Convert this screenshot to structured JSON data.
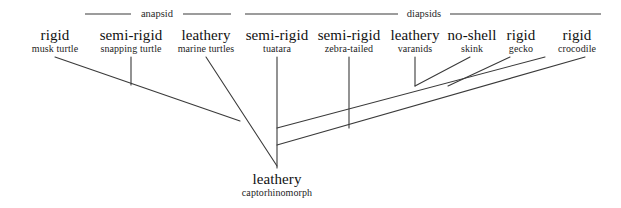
{
  "figure": {
    "width": 621,
    "height": 208,
    "background_color": "#ffffff",
    "line_color": "#3a3a3a"
  },
  "clade_brackets": [
    {
      "id": "anapsid",
      "label": "anapsid",
      "label_x": 157,
      "label_y": 8,
      "line_y": 14,
      "left_x": 85,
      "right_x": 231
    },
    {
      "id": "diapsids",
      "label": "diapsids",
      "label_x": 424,
      "label_y": 8,
      "line_y": 14,
      "left_x": 245,
      "right_x": 601
    }
  ],
  "taxa": [
    {
      "id": "musk-turtle",
      "egg_type": "rigid",
      "name": "musk turtle",
      "x": 55,
      "y": 28,
      "clade": "anapsid"
    },
    {
      "id": "snapping-turtle",
      "egg_type": "semi-rigid",
      "name": "snapping turtle",
      "x": 131,
      "y": 28,
      "clade": "anapsid"
    },
    {
      "id": "marine-turtles",
      "egg_type": "leathery",
      "name": "marine turtles",
      "x": 206,
      "y": 28,
      "clade": "anapsid"
    },
    {
      "id": "tuatara",
      "egg_type": "semi-rigid",
      "name": "tuatara",
      "x": 277,
      "y": 28,
      "clade": "diapsids"
    },
    {
      "id": "zebra-tailed",
      "egg_type": "semi-rigid",
      "name": "zebra-tailed",
      "x": 349,
      "y": 28,
      "clade": "diapsids"
    },
    {
      "id": "varanids",
      "egg_type": "leathery",
      "name": "varanids",
      "x": 415,
      "y": 28,
      "clade": "diapsids"
    },
    {
      "id": "skink",
      "egg_type": "no-shell",
      "name": "skink",
      "x": 472,
      "y": 28,
      "clade": "diapsids"
    },
    {
      "id": "gecko",
      "egg_type": "rigid",
      "name": "gecko",
      "x": 521,
      "y": 28,
      "clade": "diapsids"
    },
    {
      "id": "crocodile",
      "egg_type": "rigid",
      "name": "crocodile",
      "x": 577,
      "y": 28,
      "clade": "diapsids"
    }
  ],
  "root": {
    "id": "captorhinomorph",
    "egg_type": "leathery",
    "name": "captorhinomorph",
    "x": 277,
    "y": 172
  },
  "branches": [
    {
      "id": "branch-musk-turtle-to-anapsid-node",
      "from": [
        55,
        57
      ],
      "to": [
        240,
        121
      ]
    },
    {
      "id": "branch-snapping-turtle-stub",
      "from": [
        131,
        57
      ],
      "to": [
        131,
        85
      ]
    },
    {
      "id": "branch-marine-turtles-to-root",
      "from": [
        206,
        57
      ],
      "to": [
        277,
        166
      ]
    },
    {
      "id": "branch-tuatara-trunk",
      "from": [
        277,
        57
      ],
      "to": [
        277,
        168
      ]
    },
    {
      "id": "branch-zebra-tailed-stub",
      "from": [
        349,
        57
      ],
      "to": [
        349,
        128
      ]
    },
    {
      "id": "branch-varanids-stub",
      "from": [
        415,
        57
      ],
      "to": [
        415,
        86
      ]
    },
    {
      "id": "branch-diapsid-upper-spine",
      "from": [
        277,
        128
      ],
      "to": [
        545,
        57
      ]
    },
    {
      "id": "branch-diapsid-lower-spine",
      "from": [
        277,
        145
      ],
      "to": [
        585,
        57
      ]
    },
    {
      "id": "branch-skink-join",
      "from": [
        415,
        86
      ],
      "to": [
        470,
        57
      ]
    },
    {
      "id": "branch-gecko-join",
      "from": [
        448,
        86
      ],
      "to": [
        510,
        57
      ]
    }
  ]
}
